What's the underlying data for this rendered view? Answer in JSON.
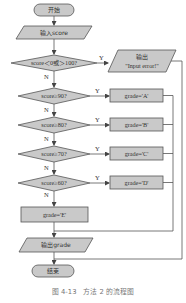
{
  "diagram": {
    "start": "开始",
    "input": "输入score",
    "decision1": "score＜0或＞100?",
    "error_output_line1": "输出",
    "error_output_line2": "\"Input error!\"",
    "decision2": "score≥90?",
    "decision3": "score≥80?",
    "decision4": "score≥70?",
    "decision5": "score≥60?",
    "grade_a": "grade='A'",
    "grade_b": "grade='B'",
    "grade_c": "grade='C'",
    "grade_d": "grade='D'",
    "grade_e": "grade='E'",
    "output": "输出grade",
    "end": "结束",
    "yes": "Y",
    "no": "N"
  },
  "caption": "图 4-13　方法 2 的流程图",
  "colors": {
    "shape_fill": "#c9c9c9",
    "stroke": "#555555",
    "caption": "#777777"
  }
}
